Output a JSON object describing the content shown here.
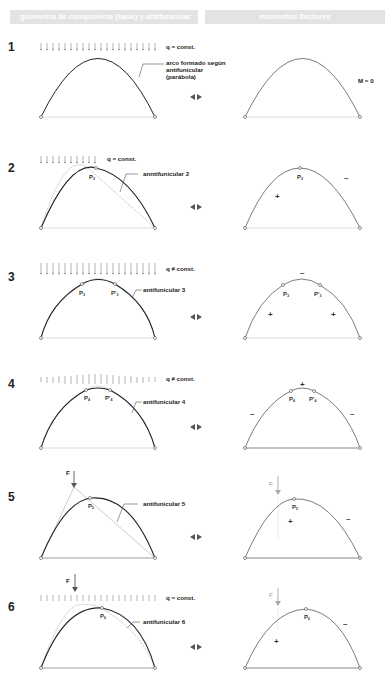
{
  "headers": {
    "left": "geometría de componente (base) y antifunicular",
    "right": "momentos flectores"
  },
  "colors": {
    "header_bg": "#e3e3e3",
    "arch": "#222222",
    "funicular": "#888888",
    "base": "#dddddd",
    "force_light": "#aaaaaa",
    "force_dark": "#555555"
  },
  "rows": [
    {
      "number": "1",
      "load_label": "q = const.",
      "curve_label": "arco formado según",
      "curve_label_2": "antifunicular",
      "curve_label_3": "(parábola)",
      "moment_label": "M = 0"
    },
    {
      "number": "2",
      "load_label": "q = const.",
      "curve_label": "anntifunicular 2",
      "point": "P",
      "point_sub": "2",
      "signs": [
        "+",
        "–"
      ]
    },
    {
      "number": "3",
      "load_label": "q ≠ const.",
      "curve_label": "antifunicular 3",
      "point": "P",
      "point_sub": "3",
      "point2": "P'",
      "point2_sub": "3",
      "signs": [
        "–",
        "+",
        "+"
      ]
    },
    {
      "number": "4",
      "load_label": "q ≠ const.",
      "curve_label": "antifunicular 4",
      "point": "P",
      "point_sub": "4",
      "point2": "P'",
      "point2_sub": "4",
      "signs": [
        "+",
        "–",
        "–"
      ]
    },
    {
      "number": "5",
      "force_label": "F",
      "curve_label": "antifunicular 5",
      "point": "P",
      "point_sub": "5",
      "signs": [
        "+",
        "–"
      ]
    },
    {
      "number": "6",
      "force_label": "F",
      "load_label": "q = const.",
      "curve_label": "antifunicular 6",
      "point": "P",
      "point_sub": "6",
      "signs": [
        "+",
        "–"
      ]
    }
  ],
  "icons": {
    "compare": "left-right-triangle-arrows-icon",
    "load": "down-arrow-icon"
  }
}
